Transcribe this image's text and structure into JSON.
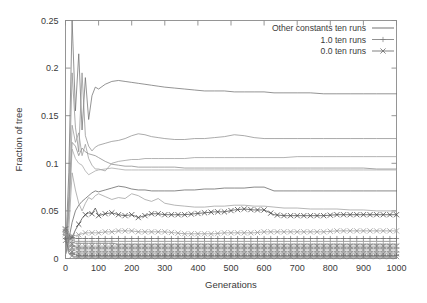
{
  "chart_data": {
    "type": "line",
    "title": "",
    "xlabel": "Generations",
    "ylabel": "Fraction of tree",
    "xlim": [
      0,
      1000
    ],
    "ylim": [
      0,
      0.25
    ],
    "xticks": [
      0,
      100,
      200,
      300,
      400,
      500,
      600,
      700,
      800,
      900,
      1000
    ],
    "xtick_labels": [
      "0",
      "100",
      "200",
      "300",
      "400",
      "500",
      "600",
      "700",
      "800",
      "900",
      "1000"
    ],
    "yticks": [
      0,
      0.05,
      0.1,
      0.15,
      0.2,
      0.25
    ],
    "ytick_labels": [
      "0",
      "0.05",
      "0.1",
      "0.15",
      "0.2",
      "0.25"
    ],
    "grid": false,
    "legend_position": "top-right",
    "legend": [
      {
        "name": "Other constants ten runs",
        "marker": "none",
        "color": "#5a5a5a"
      },
      {
        "name": "1.0 ten runs",
        "marker": "plus",
        "color": "#7d7d7d"
      },
      {
        "name": "0.0 ten runs",
        "marker": "cross",
        "color": "#6a6a6a"
      }
    ],
    "x": [
      0,
      10,
      20,
      30,
      40,
      50,
      60,
      70,
      80,
      90,
      100,
      120,
      140,
      160,
      180,
      200,
      220,
      240,
      260,
      280,
      300,
      330,
      360,
      390,
      420,
      450,
      480,
      510,
      540,
      570,
      600,
      630,
      660,
      700,
      740,
      780,
      820,
      860,
      900,
      940,
      1000
    ],
    "series": [
      {
        "name": "Other constants run A",
        "group": "Other constants ten runs",
        "marker": "none",
        "color": "#707070",
        "values": [
          0.004,
          0.09,
          0.25,
          0.155,
          0.215,
          0.135,
          0.19,
          0.146,
          0.171,
          0.18,
          0.178,
          0.183,
          0.186,
          0.187,
          0.186,
          0.185,
          0.184,
          0.183,
          0.182,
          0.181,
          0.18,
          0.179,
          0.178,
          0.177,
          0.176,
          0.176,
          0.176,
          0.175,
          0.175,
          0.175,
          0.175,
          0.174,
          0.174,
          0.174,
          0.174,
          0.173,
          0.173,
          0.173,
          0.173,
          0.173,
          0.173
        ]
      },
      {
        "name": "Other constants run B",
        "group": "Other constants ten runs",
        "marker": "none",
        "color": "#8f8f8f",
        "values": [
          0.004,
          0.065,
          0.195,
          0.138,
          0.112,
          0.195,
          0.129,
          0.118,
          0.113,
          0.117,
          0.119,
          0.121,
          0.123,
          0.124,
          0.126,
          0.129,
          0.131,
          0.13,
          0.128,
          0.127,
          0.126,
          0.125,
          0.125,
          0.126,
          0.126,
          0.127,
          0.128,
          0.13,
          0.129,
          0.127,
          0.126,
          0.126,
          0.126,
          0.126,
          0.126,
          0.126,
          0.126,
          0.126,
          0.126,
          0.126,
          0.126
        ]
      },
      {
        "name": "Other constants run C",
        "group": "Other constants ten runs",
        "marker": "none",
        "color": "#9a9a9a",
        "values": [
          0.004,
          0.055,
          0.14,
          0.122,
          0.132,
          0.108,
          0.12,
          0.105,
          0.098,
          0.094,
          0.094,
          0.092,
          0.1,
          0.102,
          0.103,
          0.104,
          0.104,
          0.105,
          0.105,
          0.105,
          0.105,
          0.105,
          0.105,
          0.106,
          0.106,
          0.106,
          0.106,
          0.106,
          0.106,
          0.106,
          0.106,
          0.106,
          0.106,
          0.107,
          0.107,
          0.107,
          0.107,
          0.107,
          0.107,
          0.107,
          0.107
        ]
      },
      {
        "name": "Other constants run D",
        "group": "Other constants ten runs",
        "marker": "none",
        "color": "#888888",
        "values": [
          0.004,
          0.05,
          0.122,
          0.118,
          0.108,
          0.116,
          0.112,
          0.11,
          0.109,
          0.108,
          0.106,
          0.102,
          0.099,
          0.098,
          0.097,
          0.097,
          0.096,
          0.096,
          0.096,
          0.096,
          0.096,
          0.096,
          0.095,
          0.095,
          0.095,
          0.095,
          0.095,
          0.095,
          0.095,
          0.095,
          0.095,
          0.095,
          0.095,
          0.095,
          0.095,
          0.095,
          0.095,
          0.095,
          0.095,
          0.094,
          0.094
        ]
      },
      {
        "name": "Other constants run E",
        "group": "Other constants ten runs",
        "marker": "none",
        "color": "#a5a5a5",
        "values": [
          0.004,
          0.045,
          0.115,
          0.105,
          0.1,
          0.098,
          0.092,
          0.088,
          0.09,
          0.092,
          0.093,
          0.094,
          0.095,
          0.094,
          0.093,
          0.093,
          0.093,
          0.093,
          0.093,
          0.093,
          0.093,
          0.093,
          0.093,
          0.093,
          0.093,
          0.093,
          0.093,
          0.093,
          0.093,
          0.093,
          0.093,
          0.093,
          0.093,
          0.093,
          0.093,
          0.093,
          0.093,
          0.093,
          0.093,
          0.093,
          0.093
        ]
      },
      {
        "name": "Other constants run F",
        "group": "Other constants ten runs",
        "marker": "none",
        "color": "#626262",
        "values": [
          0.004,
          0.02,
          0.038,
          0.05,
          0.056,
          0.06,
          0.063,
          0.066,
          0.069,
          0.071,
          0.07,
          0.072,
          0.074,
          0.076,
          0.075,
          0.073,
          0.072,
          0.072,
          0.071,
          0.071,
          0.071,
          0.071,
          0.072,
          0.072,
          0.073,
          0.073,
          0.074,
          0.074,
          0.074,
          0.075,
          0.075,
          0.071,
          0.071,
          0.071,
          0.071,
          0.071,
          0.071,
          0.071,
          0.071,
          0.071,
          0.071
        ]
      },
      {
        "name": "Other constants run G",
        "group": "Other constants ten runs",
        "marker": "none",
        "color": "#9e9e9e",
        "values": [
          0.004,
          0.03,
          0.09,
          0.072,
          0.058,
          0.05,
          0.058,
          0.064,
          0.062,
          0.066,
          0.068,
          0.065,
          0.062,
          0.064,
          0.063,
          0.068,
          0.066,
          0.062,
          0.06,
          0.063,
          0.058,
          0.056,
          0.055,
          0.054,
          0.054,
          0.055,
          0.055,
          0.056,
          0.056,
          0.055,
          0.055,
          0.054,
          0.053,
          0.053,
          0.052,
          0.052,
          0.052,
          0.051,
          0.051,
          0.05,
          0.05
        ]
      },
      {
        "name": "0.0 run primary",
        "group": "0.0 ten runs",
        "marker": "cross",
        "color": "#4a4a4a",
        "values": [
          0.031,
          0.02,
          0.022,
          0.03,
          0.036,
          0.042,
          0.046,
          0.048,
          0.047,
          0.053,
          0.045,
          0.047,
          0.048,
          0.046,
          0.045,
          0.046,
          0.043,
          0.045,
          0.047,
          0.047,
          0.046,
          0.046,
          0.046,
          0.047,
          0.048,
          0.049,
          0.049,
          0.051,
          0.052,
          0.051,
          0.051,
          0.046,
          0.045,
          0.045,
          0.045,
          0.045,
          0.046,
          0.046,
          0.046,
          0.046,
          0.046
        ]
      },
      {
        "name": "0.0 run secondary",
        "group": "0.0 ten runs",
        "marker": "cross",
        "color": "#9b9b9b",
        "values": [
          0.03,
          0.026,
          0.024,
          0.024,
          0.025,
          0.026,
          0.027,
          0.027,
          0.027,
          0.027,
          0.027,
          0.028,
          0.028,
          0.029,
          0.029,
          0.029,
          0.028,
          0.028,
          0.028,
          0.028,
          0.028,
          0.027,
          0.026,
          0.026,
          0.026,
          0.026,
          0.027,
          0.027,
          0.027,
          0.027,
          0.028,
          0.028,
          0.028,
          0.028,
          0.028,
          0.028,
          0.029,
          0.029,
          0.029,
          0.029,
          0.029
        ]
      },
      {
        "name": "1.0 run primary",
        "group": "1.0 ten runs",
        "marker": "plus",
        "color": "#6e6e6e",
        "values": [
          0.03,
          0.024,
          0.022,
          0.021,
          0.021,
          0.021,
          0.021,
          0.021,
          0.021,
          0.021,
          0.021,
          0.021,
          0.021,
          0.021,
          0.021,
          0.021,
          0.021,
          0.021,
          0.021,
          0.021,
          0.021,
          0.021,
          0.021,
          0.021,
          0.021,
          0.021,
          0.021,
          0.021,
          0.021,
          0.021,
          0.021,
          0.021,
          0.021,
          0.021,
          0.021,
          0.021,
          0.021,
          0.021,
          0.021,
          0.021,
          0.021
        ]
      },
      {
        "name": "Mixed band run H",
        "group": "Other constants ten runs",
        "marker": "none",
        "color": "#7a7a7a",
        "values": [
          0.03,
          0.022,
          0.019,
          0.018,
          0.018,
          0.018,
          0.018,
          0.018,
          0.018,
          0.018,
          0.018,
          0.018,
          0.018,
          0.018,
          0.018,
          0.018,
          0.018,
          0.018,
          0.018,
          0.018,
          0.018,
          0.018,
          0.018,
          0.018,
          0.018,
          0.018,
          0.018,
          0.018,
          0.018,
          0.018,
          0.018,
          0.018,
          0.018,
          0.018,
          0.018,
          0.018,
          0.018,
          0.018,
          0.018,
          0.018,
          0.018
        ]
      },
      {
        "name": "Mixed band run I",
        "group": "1.0 ten runs",
        "marker": "plus",
        "color": "#8b8b8b",
        "values": [
          0.029,
          0.02,
          0.017,
          0.016,
          0.016,
          0.016,
          0.016,
          0.016,
          0.016,
          0.016,
          0.016,
          0.016,
          0.016,
          0.015,
          0.015,
          0.015,
          0.015,
          0.015,
          0.015,
          0.015,
          0.015,
          0.015,
          0.015,
          0.015,
          0.015,
          0.015,
          0.015,
          0.015,
          0.015,
          0.015,
          0.015,
          0.015,
          0.015,
          0.015,
          0.015,
          0.015,
          0.015,
          0.015,
          0.015,
          0.015,
          0.015
        ]
      },
      {
        "name": "Mixed band run J",
        "group": "0.0 ten runs",
        "marker": "cross",
        "color": "#858585",
        "values": [
          0.028,
          0.018,
          0.015,
          0.013,
          0.013,
          0.013,
          0.013,
          0.013,
          0.013,
          0.013,
          0.013,
          0.013,
          0.013,
          0.013,
          0.013,
          0.013,
          0.013,
          0.013,
          0.013,
          0.013,
          0.013,
          0.013,
          0.013,
          0.013,
          0.013,
          0.013,
          0.013,
          0.013,
          0.013,
          0.013,
          0.013,
          0.013,
          0.013,
          0.013,
          0.013,
          0.013,
          0.013,
          0.013,
          0.013,
          0.013,
          0.013
        ]
      },
      {
        "name": "Mixed band run K",
        "group": "1.0 ten runs",
        "marker": "plus",
        "color": "#7f7f7f",
        "values": [
          0.027,
          0.016,
          0.013,
          0.012,
          0.011,
          0.011,
          0.011,
          0.011,
          0.011,
          0.011,
          0.011,
          0.011,
          0.011,
          0.011,
          0.011,
          0.011,
          0.011,
          0.011,
          0.011,
          0.011,
          0.011,
          0.011,
          0.011,
          0.011,
          0.011,
          0.011,
          0.011,
          0.011,
          0.011,
          0.011,
          0.011,
          0.011,
          0.011,
          0.011,
          0.011,
          0.011,
          0.011,
          0.011,
          0.011,
          0.011,
          0.011
        ]
      },
      {
        "name": "Mixed band run L",
        "group": "0.0 ten runs",
        "marker": "cross",
        "color": "#909090",
        "values": [
          0.026,
          0.014,
          0.011,
          0.01,
          0.009,
          0.009,
          0.009,
          0.009,
          0.009,
          0.009,
          0.009,
          0.009,
          0.009,
          0.009,
          0.009,
          0.009,
          0.009,
          0.009,
          0.009,
          0.009,
          0.009,
          0.009,
          0.009,
          0.009,
          0.009,
          0.009,
          0.009,
          0.009,
          0.009,
          0.009,
          0.009,
          0.009,
          0.009,
          0.009,
          0.009,
          0.009,
          0.009,
          0.009,
          0.009,
          0.009,
          0.009
        ]
      },
      {
        "name": "Mixed band run M",
        "group": "1.0 ten runs",
        "marker": "plus",
        "color": "#989898",
        "values": [
          0.025,
          0.012,
          0.009,
          0.008,
          0.007,
          0.007,
          0.007,
          0.007,
          0.007,
          0.007,
          0.007,
          0.007,
          0.007,
          0.007,
          0.007,
          0.007,
          0.007,
          0.007,
          0.007,
          0.007,
          0.007,
          0.007,
          0.007,
          0.007,
          0.007,
          0.007,
          0.007,
          0.007,
          0.007,
          0.007,
          0.007,
          0.007,
          0.007,
          0.007,
          0.007,
          0.007,
          0.007,
          0.007,
          0.007,
          0.007,
          0.007
        ]
      },
      {
        "name": "Mixed band run N",
        "group": "0.0 ten runs",
        "marker": "cross",
        "color": "#8d8d8d",
        "values": [
          0.023,
          0.01,
          0.007,
          0.006,
          0.005,
          0.005,
          0.005,
          0.005,
          0.005,
          0.005,
          0.005,
          0.005,
          0.005,
          0.005,
          0.005,
          0.005,
          0.005,
          0.005,
          0.005,
          0.005,
          0.005,
          0.005,
          0.005,
          0.005,
          0.005,
          0.005,
          0.005,
          0.005,
          0.005,
          0.005,
          0.005,
          0.005,
          0.005,
          0.005,
          0.005,
          0.005,
          0.005,
          0.005,
          0.005,
          0.005,
          0.005
        ]
      },
      {
        "name": "Mixed band run O",
        "group": "1.0 ten runs",
        "marker": "plus",
        "color": "#6b6b6b",
        "values": [
          0.021,
          0.008,
          0.005,
          0.004,
          0.003,
          0.003,
          0.003,
          0.003,
          0.003,
          0.003,
          0.003,
          0.003,
          0.003,
          0.003,
          0.003,
          0.003,
          0.003,
          0.003,
          0.003,
          0.003,
          0.003,
          0.003,
          0.003,
          0.003,
          0.003,
          0.003,
          0.003,
          0.003,
          0.003,
          0.003,
          0.003,
          0.003,
          0.003,
          0.003,
          0.003,
          0.003,
          0.003,
          0.003,
          0.003,
          0.003,
          0.003
        ]
      },
      {
        "name": "Mixed band run P",
        "group": "0.0 ten runs",
        "marker": "cross",
        "color": "#7c7c7c",
        "values": [
          0.019,
          0.006,
          0.003,
          0.002,
          0.002,
          0.002,
          0.002,
          0.002,
          0.002,
          0.002,
          0.002,
          0.002,
          0.002,
          0.002,
          0.002,
          0.002,
          0.002,
          0.002,
          0.002,
          0.002,
          0.002,
          0.002,
          0.002,
          0.002,
          0.002,
          0.002,
          0.002,
          0.002,
          0.002,
          0.002,
          0.002,
          0.002,
          0.002,
          0.002,
          0.002,
          0.002,
          0.002,
          0.002,
          0.002,
          0.002,
          0.002
        ]
      },
      {
        "name": "Mixed band run Q",
        "group": "Other constants ten runs",
        "marker": "none",
        "color": "#999999",
        "values": [
          0.016,
          0.005,
          0.002,
          0.001,
          0.001,
          0.001,
          0.001,
          0.001,
          0.001,
          0.001,
          0.001,
          0.001,
          0.001,
          0.001,
          0.001,
          0.001,
          0.001,
          0.001,
          0.001,
          0.001,
          0.001,
          0.001,
          0.001,
          0.001,
          0.001,
          0.001,
          0.001,
          0.001,
          0.001,
          0.001,
          0.001,
          0.001,
          0.001,
          0.001,
          0.001,
          0.001,
          0.001,
          0.001,
          0.001,
          0.001,
          0.001
        ]
      }
    ]
  }
}
